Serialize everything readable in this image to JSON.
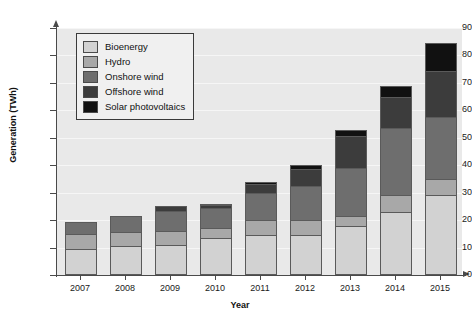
{
  "chart_data": {
    "type": "bar",
    "subtype": "stacked-bar",
    "title": "",
    "xlabel": "Year",
    "ylabel": "Generation (TWh)",
    "categories": [
      "2007",
      "2008",
      "2009",
      "2010",
      "2011",
      "2012",
      "2013",
      "2014",
      "2015"
    ],
    "ylim": [
      0,
      90
    ],
    "ytick_values": [
      0,
      10,
      20,
      30,
      40,
      50,
      60,
      70,
      80,
      90
    ],
    "ytick_labels": [
      "0",
      "10",
      "20",
      "30",
      "40",
      "50",
      "60",
      "70",
      "80",
      "90"
    ],
    "grid": true,
    "grid_axis": "y",
    "legend_position": "top-left",
    "series": [
      {
        "name": "Bioenergy",
        "color": "#d2d2d2",
        "values": [
          9.5,
          10.5,
          11.0,
          13.5,
          14.5,
          14.5,
          18.0,
          23.0,
          29.0
        ]
      },
      {
        "name": "Hydro",
        "color": "#a8a8a8",
        "values": [
          5.5,
          5.0,
          5.0,
          3.5,
          5.5,
          5.5,
          3.5,
          6.0,
          6.0
        ]
      },
      {
        "name": "Onshore wind",
        "color": "#6e6e6e",
        "values": [
          4.4,
          6.0,
          7.5,
          7.5,
          10.0,
          12.5,
          17.5,
          24.5,
          22.5
        ]
      },
      {
        "name": "Offshore wind",
        "color": "#3c3c3c",
        "values": [
          0.0,
          0.0,
          1.5,
          1.0,
          3.0,
          6.0,
          11.5,
          11.5,
          17.0
        ]
      },
      {
        "name": "Solar photovoltaics",
        "color": "#111111",
        "values": [
          0.0,
          0.0,
          0.0,
          0.5,
          1.0,
          1.5,
          2.5,
          4.0,
          10.0
        ]
      }
    ],
    "totals": [
      19.4,
      21.5,
      25.0,
      26.0,
      34.0,
      40.0,
      53.0,
      64.0,
      83.0
    ]
  },
  "legend": {
    "items": [
      {
        "label": "Bioenergy"
      },
      {
        "label": "Hydro"
      },
      {
        "label": "Onshore wind"
      },
      {
        "label": "Offshore wind"
      },
      {
        "label": "Solar photovoltaics"
      }
    ]
  },
  "axes": {
    "y_title": "Generation (TWh)",
    "x_title": "Year"
  },
  "colors": {
    "plot_background": "#e9e9e9",
    "page_background": "#ffffff",
    "axis": "#4a4a4a",
    "gridline": "#f6f6f6",
    "bar_outline": "#5a5a5a"
  }
}
